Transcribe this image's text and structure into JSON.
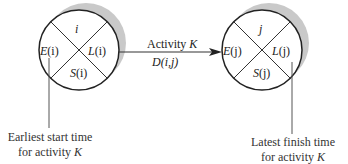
{
  "node_i": {
    "top": "i",
    "left_E": "E",
    "left_arg": "(i)",
    "right_L": "L",
    "right_arg": "(i)",
    "bottom_S": "S",
    "bottom_arg": "(i)"
  },
  "node_j": {
    "top": "j",
    "left_E": "E",
    "left_arg": "(j)",
    "right_L": "L",
    "right_arg": "(j)",
    "bottom_S": "S",
    "bottom_arg": "(j)"
  },
  "arrow": {
    "label_word": "Activity ",
    "label_var": "K",
    "duration_D": "D",
    "duration_arg": "(i,j)"
  },
  "captions": {
    "left_line1": "Earliest start time",
    "left_line2_text": "for activity ",
    "left_line2_var": "K",
    "right_line1": "Latest finish time",
    "right_line2_text": "for activity ",
    "right_line2_var": "K"
  }
}
